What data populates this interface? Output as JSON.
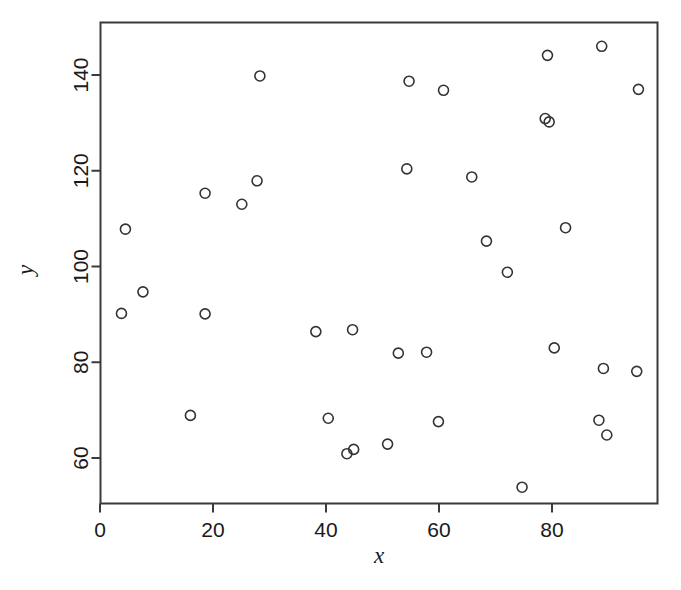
{
  "chart_data": {
    "type": "scatter",
    "title": "",
    "xlabel": "x",
    "ylabel": "y",
    "xlim": [
      1.5,
      98.8
    ],
    "ylim": [
      52.0,
      148.7
    ],
    "xticks": [
      0,
      20,
      40,
      60,
      80
    ],
    "yticks": [
      60,
      80,
      100,
      120,
      140
    ],
    "xticklabels": [
      "0",
      "20",
      "40",
      "60",
      "80"
    ],
    "yticklabels": [
      "60",
      "80",
      "100",
      "120",
      "140"
    ],
    "grid": false,
    "legend": null,
    "marker": "open-circle",
    "marker_color": "#333333",
    "marker_size": 5,
    "n_points": 36,
    "x": [
      4.5,
      3.8,
      7.6,
      16.0,
      18.6,
      18.6,
      25.1,
      27.8,
      28.3,
      38.2,
      40.4,
      43.7,
      44.9,
      44.7,
      50.9,
      52.8,
      54.3,
      54.7,
      57.8,
      59.9,
      60.8,
      65.8,
      68.4,
      72.1,
      74.7,
      78.8,
      79.5,
      79.2,
      80.4,
      82.4,
      88.8,
      89.1,
      88.3,
      89.7,
      95.0,
      95.3
    ],
    "y": [
      107.8,
      90.2,
      94.7,
      68.9,
      90.1,
      115.3,
      113.0,
      117.9,
      139.8,
      86.4,
      68.3,
      60.9,
      61.8,
      86.8,
      62.9,
      81.9,
      120.4,
      138.7,
      82.1,
      67.6,
      136.8,
      118.7,
      105.3,
      98.8,
      53.9,
      130.9,
      130.2,
      144.1,
      83.0,
      108.1,
      146.0,
      78.7,
      67.9,
      64.8,
      78.1,
      137.0
    ]
  },
  "axes": {
    "x_axis_name": "x-axis",
    "y_axis_name": "y-axis",
    "box_border_color": "#3a3a3a"
  }
}
